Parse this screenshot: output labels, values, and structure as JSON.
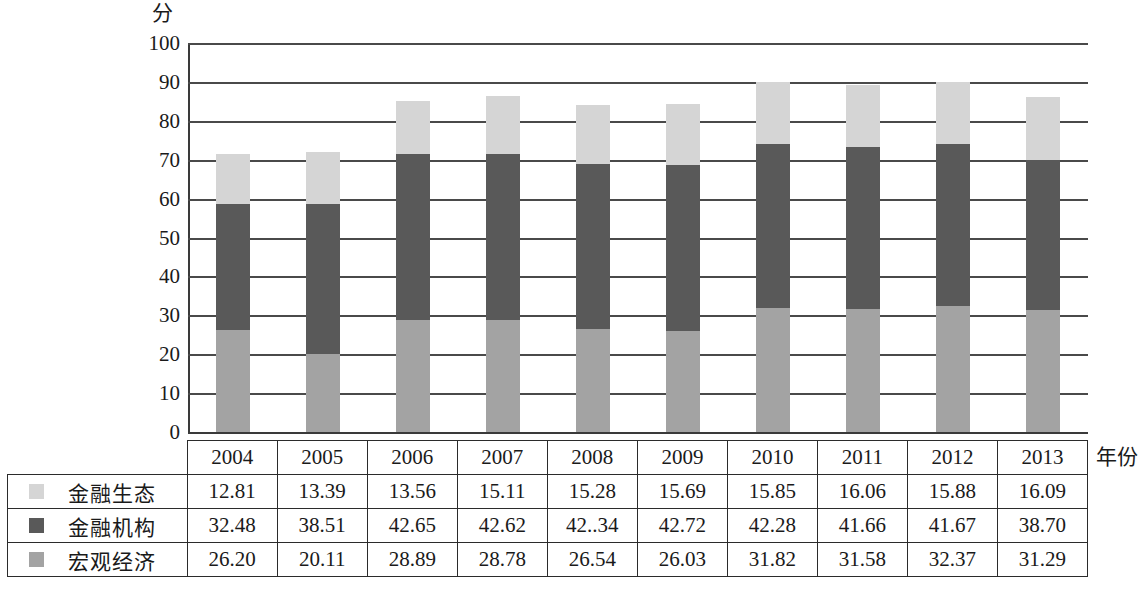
{
  "chart_data": {
    "type": "bar",
    "subtype": "stacked-column",
    "title": "",
    "xlabel": "年份",
    "ylabel": "分",
    "ylim": [
      0,
      100
    ],
    "yticks": [
      0,
      10,
      20,
      30,
      40,
      50,
      60,
      70,
      80,
      90,
      100
    ],
    "grid": true,
    "legend_position": "table-left-column",
    "categories": [
      "2004",
      "2005",
      "2006",
      "2007",
      "2008",
      "2009",
      "2010",
      "2011",
      "2012",
      "2013"
    ],
    "stack_order_bottom_to_top": [
      "宏观经济",
      "金融机构",
      "金融生态"
    ],
    "series": [
      {
        "name": "金融生态",
        "color": "#d5d5d5",
        "values": [
          12.81,
          13.39,
          13.56,
          15.11,
          15.28,
          15.69,
          15.85,
          16.06,
          15.88,
          16.09
        ],
        "labels": [
          "12.81",
          "13.39",
          "13.56",
          "15.11",
          "15.28",
          "15.69",
          "15.85",
          "16.06",
          "15.88",
          "16.09"
        ]
      },
      {
        "name": "金融机构",
        "color": "#595959",
        "values": [
          32.48,
          38.51,
          42.65,
          42.62,
          42.34,
          42.72,
          42.28,
          41.66,
          41.67,
          38.7
        ],
        "labels": [
          "32.48",
          "38.51",
          "42.65",
          "42.62",
          "42..34",
          "42.72",
          "42.28",
          "41.66",
          "41.67",
          "38.70"
        ]
      },
      {
        "name": "宏观经济",
        "color": "#a3a3a3",
        "values": [
          26.2,
          20.11,
          28.89,
          28.78,
          26.54,
          26.03,
          31.82,
          31.58,
          32.37,
          31.29
        ],
        "labels": [
          "26.20",
          "20.11",
          "28.89",
          "28.78",
          "26.54",
          "26.03",
          "31.82",
          "31.58",
          "32.37",
          "31.29"
        ]
      }
    ],
    "totals": [
      71.49,
      72.01,
      85.1,
      86.51,
      84.16,
      84.44,
      89.95,
      89.3,
      89.92,
      86.08
    ]
  },
  "axis": {
    "unit_label": "分",
    "x_title": "年份",
    "tick_labels": [
      "100",
      "90",
      "80",
      "70",
      "60",
      "50",
      "40",
      "30",
      "20",
      "10",
      "0"
    ]
  },
  "table": {
    "header_corner": "",
    "years": [
      "2004",
      "2005",
      "2006",
      "2007",
      "2008",
      "2009",
      "2010",
      "2011",
      "2012",
      "2013"
    ],
    "rows": [
      {
        "label": "金融生态",
        "swatch_color": "#d5d5d5",
        "values": [
          "12.81",
          "13.39",
          "13.56",
          "15.11",
          "15.28",
          "15.69",
          "15.85",
          "16.06",
          "15.88",
          "16.09"
        ]
      },
      {
        "label": "金融机构",
        "swatch_color": "#595959",
        "values": [
          "32.48",
          "38.51",
          "42.65",
          "42.62",
          "42..34",
          "42.72",
          "42.28",
          "41.66",
          "41.67",
          "38.70"
        ]
      },
      {
        "label": "宏观经济",
        "swatch_color": "#a3a3a3",
        "values": [
          "26.20",
          "20.11",
          "28.89",
          "28.78",
          "26.54",
          "26.03",
          "31.82",
          "31.58",
          "32.37",
          "31.29"
        ]
      }
    ]
  },
  "colors": {
    "series_light": "#d5d5d5",
    "series_dark": "#595959",
    "series_medium": "#a3a3a3",
    "gridline": "#4a4a4a",
    "border": "#2b2b2b",
    "background": "#ffffff"
  }
}
